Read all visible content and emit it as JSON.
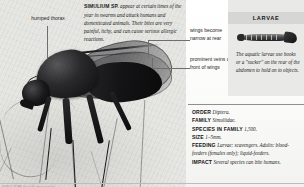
{
  "plate": {
    "credit": "SIMULIIDAE blackfly macro plate"
  },
  "main_caption": {
    "species": "SIMULIUM SP.",
    "text": " appear at certain times of the year in swarms and attack humans and domesticated animals. Their bites are very painful, itchy, and can cause serious allergic reactions."
  },
  "callouts": {
    "humped_thorax": "humped thorax",
    "wings_narrow": "wings become narrow at rear",
    "prominent_veins": "prominent veins at front of wings"
  },
  "larvae_panel": {
    "header": "LARVAE",
    "description": "The aquatic larvae use hooks or a \"sucker\" on the rear of the abdomen to hold on to objects."
  },
  "fact_table": {
    "rows": [
      {
        "label": "ORDER",
        "value": "Diptera."
      },
      {
        "label": "FAMILY",
        "value": "Simuliidae."
      },
      {
        "label": "SPECIES IN FAMILY",
        "value": "1,500."
      },
      {
        "label": "SIZE",
        "value": "1–5mm."
      },
      {
        "label": "FEEDING",
        "value": "Larvae: scavengers. Adults: blood-feeders (females only); liquid-feeders."
      },
      {
        "label": "IMPACT",
        "value": "Several species can bite humans."
      }
    ]
  },
  "colors": {
    "panel_bg": "#e9e9e7",
    "panel_header_bg": "#d6d6d4",
    "rule": "#8f8f8f",
    "text": "#141414"
  }
}
